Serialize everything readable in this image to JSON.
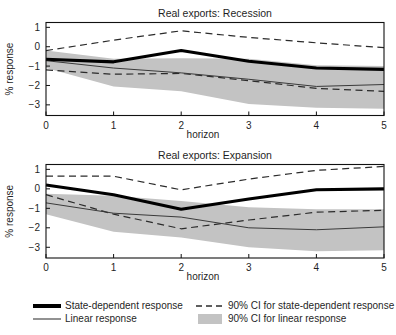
{
  "figure": {
    "y_axis_label": "% response",
    "x_axis_label": "horizon"
  },
  "legend": {
    "items": [
      {
        "key": "state",
        "label": "State-dependent response",
        "marker": "thick-solid-line"
      },
      {
        "key": "linear",
        "label": "Linear response",
        "marker": "thin-solid-line"
      },
      {
        "key": "ci_state",
        "label": "90% CI for state-dependent response",
        "marker": "dashed-line"
      },
      {
        "key": "ci_linear",
        "label": "90% CI for linear response",
        "marker": "gray-swatch"
      }
    ]
  },
  "colors": {
    "band": "#c3c3c3",
    "state_line": "#000000",
    "linear_line": "#3a3a3a",
    "ci_line": "#2b2b2b",
    "frame": "#111111"
  },
  "chart_data": [
    {
      "type": "line",
      "title": "Real exports: Recession",
      "xlabel": "horizon",
      "ylabel": "% response",
      "x": [
        0,
        1,
        2,
        3,
        4,
        5
      ],
      "xlim": [
        0,
        5
      ],
      "ylim": [
        -3.55,
        1.25
      ],
      "xticks": [
        0,
        1,
        2,
        3,
        4,
        5
      ],
      "yticks": [
        1,
        0,
        -1,
        -2,
        -3
      ],
      "grid": false,
      "legend_position": "below-figure",
      "series": [
        {
          "name": "State-dependent response",
          "style": "thick-solid",
          "values": [
            -0.65,
            -0.78,
            -0.2,
            -0.75,
            -1.1,
            -1.17
          ]
        },
        {
          "name": "90% CI upper for state-dependent response",
          "style": "dashed",
          "values": [
            -0.2,
            0.34,
            0.82,
            0.48,
            0.2,
            -0.05
          ]
        },
        {
          "name": "90% CI lower for state-dependent response",
          "style": "dashed",
          "values": [
            -1.2,
            -1.42,
            -1.38,
            -1.75,
            -2.15,
            -2.3
          ]
        },
        {
          "name": "Linear response",
          "style": "thin-solid",
          "values": [
            -0.72,
            -1.1,
            -1.35,
            -1.68,
            -2.05,
            -1.95
          ]
        },
        {
          "name": "90% CI upper for linear response",
          "style": "band-upper",
          "values": [
            -0.2,
            -0.62,
            -0.6,
            -0.62,
            -0.95,
            -1.0
          ]
        },
        {
          "name": "90% CI lower for linear response",
          "style": "band-lower",
          "values": [
            -1.1,
            -2.05,
            -2.3,
            -2.95,
            -3.15,
            -3.2
          ]
        }
      ]
    },
    {
      "type": "line",
      "title": "Real exports: Expansion",
      "xlabel": "horizon",
      "ylabel": "% response",
      "x": [
        0,
        1,
        2,
        3,
        4,
        5
      ],
      "xlim": [
        0,
        5
      ],
      "ylim": [
        -3.55,
        1.25
      ],
      "xticks": [
        0,
        1,
        2,
        3,
        4,
        5
      ],
      "yticks": [
        1,
        0,
        -1,
        -2,
        -3
      ],
      "grid": false,
      "legend_position": "below-figure",
      "series": [
        {
          "name": "State-dependent response",
          "style": "thick-solid",
          "values": [
            0.2,
            -0.3,
            -1.05,
            -0.52,
            -0.05,
            0.0
          ]
        },
        {
          "name": "90% CI upper for state-dependent response",
          "style": "dashed",
          "values": [
            0.65,
            0.65,
            -0.05,
            0.5,
            0.95,
            1.15
          ]
        },
        {
          "name": "90% CI lower for state-dependent response",
          "style": "dashed",
          "values": [
            -0.3,
            -1.3,
            -2.05,
            -1.6,
            -1.2,
            -1.1
          ]
        },
        {
          "name": "Linear response",
          "style": "thin-solid",
          "values": [
            -0.72,
            -1.25,
            -1.45,
            -2.0,
            -2.1,
            -1.95
          ]
        },
        {
          "name": "90% CI upper for linear response",
          "style": "band-upper",
          "values": [
            -0.25,
            -0.35,
            -0.62,
            -0.95,
            -1.05,
            -1.05
          ]
        },
        {
          "name": "90% CI lower for linear response",
          "style": "band-lower",
          "values": [
            -1.3,
            -2.2,
            -2.5,
            -3.0,
            -3.2,
            -3.15
          ]
        }
      ]
    }
  ]
}
